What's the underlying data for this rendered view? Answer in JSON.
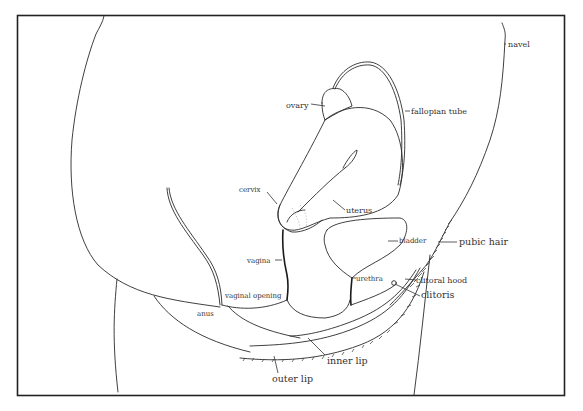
{
  "diagram": {
    "title": "",
    "labels": {
      "navel": "navel",
      "ovary": "ovary",
      "fallopian_tube": "fallopian tube",
      "cervix": "cervix",
      "uterus": "uterus",
      "bladder": "bladder",
      "pubic_hair": "pubic hair",
      "vagina": "vagina",
      "urethra": "urethra",
      "clitoral_hood": "clitoral hood",
      "clitoris": "clitoris",
      "vaginal_opening": "vaginal opening",
      "anus": "anus",
      "inner_lip": "inner lip",
      "outer_lip": "outer lip"
    },
    "colors": {
      "background": "#ffffff",
      "ink": "#2a2a2a"
    }
  }
}
